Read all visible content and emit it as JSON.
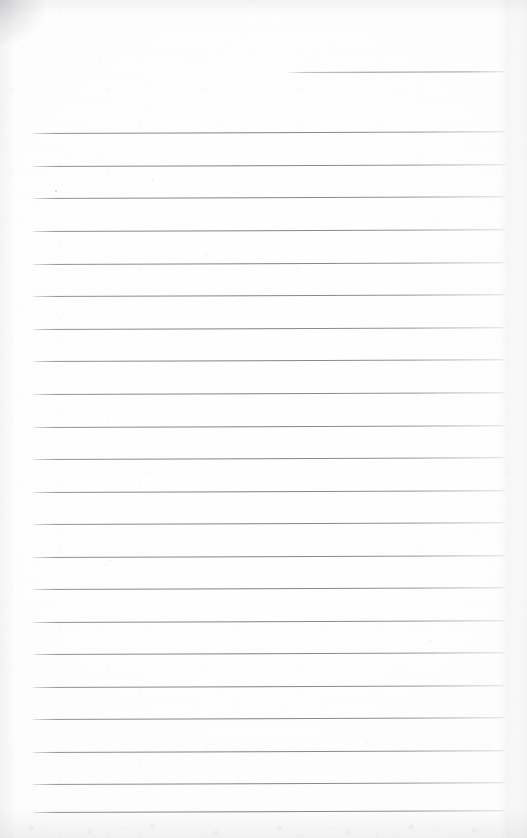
{
  "document": {
    "kind": "scanned-lined-paper",
    "title": "Blank ruled notebook page",
    "page_width": 527,
    "page_height": 838,
    "body_text": "",
    "handwriting": "",
    "printed_text": "",
    "page_number": "",
    "header_text": "",
    "footer_text": ""
  },
  "colors": {
    "paper": "#fefefe",
    "paper_shade": "#fafafa",
    "rule_line": "#7b7e87",
    "rule_line_faded": "#b0b2b8",
    "edge_shadow": "#8c8c92"
  },
  "ruling": {
    "style": "wide-ruled horizontal lines",
    "line_count": 23,
    "line_spacing_px": 32.6,
    "line_thickness_px": 1,
    "left_margin_px": 33,
    "right_margin_px": 505,
    "margin_rule": "none",
    "slope_deg": -0.22,
    "lines": [
      {
        "index": 1,
        "y": 72,
        "x_start": 287,
        "x_end": 505,
        "short": true
      },
      {
        "index": 2,
        "y": 133,
        "x_start": 33,
        "x_end": 505,
        "short": false
      },
      {
        "index": 3,
        "y": 166,
        "x_start": 33,
        "x_end": 505,
        "short": false
      },
      {
        "index": 4,
        "y": 198,
        "x_start": 33,
        "x_end": 505,
        "short": false
      },
      {
        "index": 5,
        "y": 231,
        "x_start": 33,
        "x_end": 505,
        "short": false
      },
      {
        "index": 6,
        "y": 264,
        "x_start": 33,
        "x_end": 505,
        "short": false
      },
      {
        "index": 7,
        "y": 296,
        "x_start": 33,
        "x_end": 505,
        "short": false
      },
      {
        "index": 8,
        "y": 329,
        "x_start": 33,
        "x_end": 505,
        "short": false
      },
      {
        "index": 9,
        "y": 361,
        "x_start": 33,
        "x_end": 505,
        "short": false
      },
      {
        "index": 10,
        "y": 394,
        "x_start": 33,
        "x_end": 505,
        "short": false
      },
      {
        "index": 11,
        "y": 427,
        "x_start": 33,
        "x_end": 505,
        "short": false
      },
      {
        "index": 12,
        "y": 459,
        "x_start": 33,
        "x_end": 505,
        "short": false
      },
      {
        "index": 13,
        "y": 492,
        "x_start": 33,
        "x_end": 505,
        "short": false
      },
      {
        "index": 14,
        "y": 524,
        "x_start": 33,
        "x_end": 505,
        "short": false
      },
      {
        "index": 15,
        "y": 557,
        "x_start": 33,
        "x_end": 505,
        "short": false
      },
      {
        "index": 16,
        "y": 589,
        "x_start": 33,
        "x_end": 505,
        "short": false
      },
      {
        "index": 17,
        "y": 622,
        "x_start": 33,
        "x_end": 505,
        "short": false
      },
      {
        "index": 18,
        "y": 654,
        "x_start": 33,
        "x_end": 505,
        "short": false
      },
      {
        "index": 19,
        "y": 687,
        "x_start": 33,
        "x_end": 505,
        "short": false
      },
      {
        "index": 20,
        "y": 719,
        "x_start": 33,
        "x_end": 505,
        "short": false
      },
      {
        "index": 21,
        "y": 752,
        "x_start": 33,
        "x_end": 505,
        "short": false
      },
      {
        "index": 22,
        "y": 784,
        "x_start": 33,
        "x_end": 505,
        "short": false
      },
      {
        "index": 23,
        "y": 812,
        "x_start": 33,
        "x_end": 505,
        "short": false
      }
    ]
  },
  "artifacts": {
    "corner_smudge": {
      "corner": "top-left",
      "width": 46,
      "height": 44
    },
    "right_edge_line_x": 508,
    "specks": [
      {
        "x": 55,
        "y": 190,
        "size": 1.6
      },
      {
        "x": 152,
        "y": 180,
        "size": 1.4
      },
      {
        "x": 330,
        "y": 196,
        "size": 1.2
      },
      {
        "x": 110,
        "y": 560,
        "size": 1.4
      },
      {
        "x": 430,
        "y": 640,
        "size": 1.3
      },
      {
        "x": 238,
        "y": 300,
        "size": 1.2
      },
      {
        "x": 366,
        "y": 742,
        "size": 1.3
      }
    ]
  }
}
